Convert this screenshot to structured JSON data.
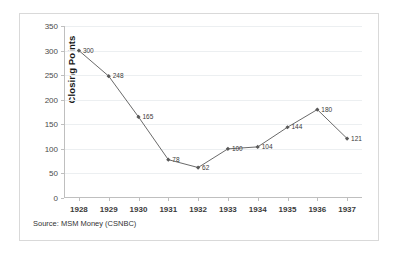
{
  "chart_data": {
    "type": "line",
    "title": "",
    "xlabel": "",
    "ylabel": "Closing Points",
    "categories": [
      "1928",
      "1929",
      "1930",
      "1931",
      "1932",
      "1933",
      "1934",
      "1935",
      "1936",
      "1937"
    ],
    "values": [
      300,
      248,
      165,
      78,
      62,
      100,
      104,
      144,
      180,
      121
    ],
    "point_labels": [
      "300",
      "248",
      "165",
      "78",
      "62",
      "100",
      "104",
      "144",
      "180",
      "121"
    ],
    "ylim": [
      0,
      350
    ],
    "ytick_values": [
      0,
      50,
      100,
      150,
      200,
      250,
      300,
      350
    ],
    "ytick_labels": [
      "0",
      "50",
      "100",
      "150",
      "200",
      "250",
      "300",
      "350"
    ],
    "grid": true,
    "grid_axis": "y",
    "legend": false,
    "marker": "diamond",
    "series_color": "#595959",
    "grid_color": "#eceff1",
    "axis_color": "#bfbfbf"
  },
  "source_note": "Source: MSM Money (CSNBC)"
}
